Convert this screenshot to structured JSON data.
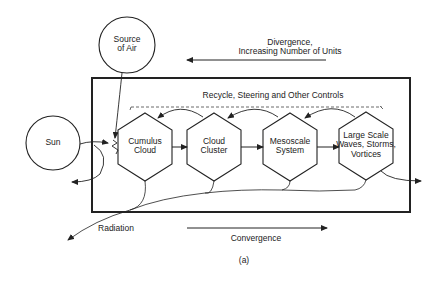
{
  "diagram": {
    "source_of_air": {
      "line1": "Source",
      "line2": "of Air"
    },
    "sun": {
      "label": "Sun"
    },
    "divergence": {
      "line1": "Divergence,",
      "line2": "Increasing Number of Units"
    },
    "recycle": {
      "label": "Recycle, Steering and Other Controls"
    },
    "units": [
      {
        "line1": "Cumulus",
        "line2": "Cloud",
        "line3": ""
      },
      {
        "line1": "Cloud",
        "line2": "Cluster",
        "line3": ""
      },
      {
        "line1": "Mesoscale",
        "line2": "System",
        "line3": ""
      },
      {
        "line1": "Large Scale",
        "line2": "Waves, Storms,",
        "line3": "Vortices"
      }
    ],
    "radiation": {
      "label": "Radiation"
    },
    "convergence": {
      "label": "Convergence"
    },
    "caption": "(a)",
    "colors": {
      "stroke": "#222222",
      "background": "#ffffff"
    }
  }
}
